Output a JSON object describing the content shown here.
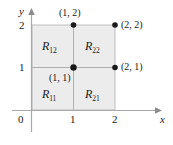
{
  "figure": {
    "kind": "coordinate-plane-diagram",
    "shade_color": "#ececec",
    "line_color": "#b3b3b3",
    "axis_color": "#a8a8a8",
    "dot_color": "#1a1a1a",
    "text_color": "#1a1a1a"
  },
  "axes": {
    "x_name": "x",
    "y_name": "y",
    "x_ticks": [
      "1",
      "2"
    ],
    "y_ticks": [
      "1",
      "2"
    ],
    "origin_label": "0"
  },
  "regions": [
    {
      "name": "R",
      "sub": "12",
      "cell": "top-left"
    },
    {
      "name": "R",
      "sub": "22",
      "cell": "top-right"
    },
    {
      "name": "R",
      "sub": "11",
      "cell": "bottom-left"
    },
    {
      "name": "R",
      "sub": "21",
      "cell": "bottom-right"
    }
  ],
  "points": [
    {
      "label": "(1, 2)",
      "x": 1,
      "y": 2
    },
    {
      "label": "(2, 2)",
      "x": 2,
      "y": 2
    },
    {
      "label": "(1, 1)",
      "x": 1,
      "y": 1
    },
    {
      "label": "(2, 1)",
      "x": 2,
      "y": 1
    }
  ]
}
